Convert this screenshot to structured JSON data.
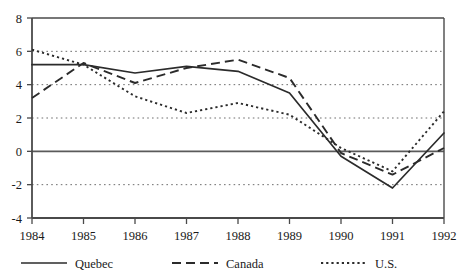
{
  "chart_data": {
    "type": "line",
    "title": "",
    "subtitle": "",
    "xlabel": "",
    "ylabel": "",
    "x": [
      1984,
      1985,
      1986,
      1987,
      1988,
      1989,
      1990,
      1991,
      1992
    ],
    "categories": [
      "1984",
      "1985",
      "1986",
      "1987",
      "1988",
      "1989",
      "1990",
      "1991",
      "1992"
    ],
    "xlim": [
      1984,
      1992
    ],
    "ylim": [
      -4,
      8
    ],
    "yticks": [
      -4,
      -2,
      0,
      2,
      4,
      6,
      8
    ],
    "ytick_labels": [
      "-4",
      "-2",
      "0",
      "2",
      "4",
      "6",
      "8"
    ],
    "grid": "horizontal-dotted",
    "zero_line": true,
    "legend_position": "bottom",
    "series": [
      {
        "name": "Quebec",
        "style": "solid",
        "color": "#2b2b2b",
        "values": [
          5.2,
          5.2,
          4.7,
          5.1,
          4.8,
          3.5,
          -0.3,
          -2.2,
          1.1
        ]
      },
      {
        "name": "Canada",
        "style": "dashed",
        "color": "#2b2b2b",
        "values": [
          3.2,
          5.3,
          4.1,
          5.0,
          5.5,
          4.4,
          -0.1,
          -1.4,
          0.2
        ]
      },
      {
        "name": "U.S.",
        "style": "dotted",
        "color": "#2b2b2b",
        "values": [
          6.1,
          5.2,
          3.3,
          2.3,
          2.9,
          2.2,
          0.2,
          -1.2,
          2.4
        ]
      }
    ]
  },
  "axis": {
    "y_tick_8": "8",
    "y_tick_6": "6",
    "y_tick_4": "4",
    "y_tick_2": "2",
    "y_tick_0": "0",
    "y_tick_m2": "-2",
    "y_tick_m4": "-4",
    "x_tick_1984": "1984",
    "x_tick_1985": "1985",
    "x_tick_1986": "1986",
    "x_tick_1987": "1987",
    "x_tick_1988": "1988",
    "x_tick_1989": "1989",
    "x_tick_1990": "1990",
    "x_tick_1991": "1991",
    "x_tick_1992": "1992"
  },
  "legend": {
    "item_quebec": "Quebec",
    "item_canada": "Canada",
    "item_us": "U.S."
  },
  "colors": {
    "line": "#2b2b2b",
    "grid": "#8a8a8a",
    "frame": "#4a4a4a",
    "background": "#ffffff"
  }
}
